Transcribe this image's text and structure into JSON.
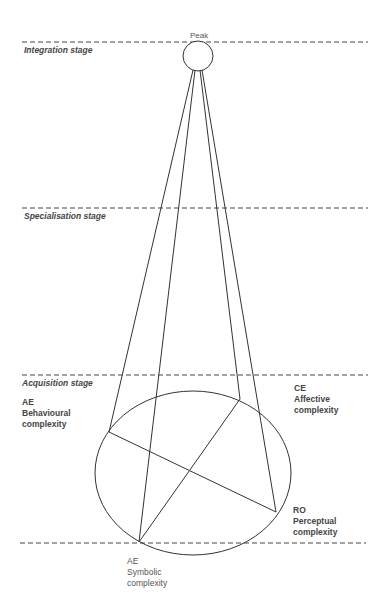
{
  "diagram": {
    "peak_label": "Peak",
    "stages": [
      {
        "label": "Integration stage",
        "y": 42
      },
      {
        "label": "Specialisation stage",
        "y": 208
      },
      {
        "label": "Acquisition stage",
        "y": 375
      }
    ],
    "nodes": {
      "behavioural": {
        "code": "AE",
        "name": "Behavioural",
        "sub": "complexity"
      },
      "affective": {
        "code": "CE",
        "name": "Affective",
        "sub": "complexity"
      },
      "perceptual": {
        "code": "RO",
        "name": "Perceptual",
        "sub": "complexity"
      },
      "symbolic": {
        "code": "AE",
        "name": "Symbolic",
        "sub": "complexity"
      }
    },
    "colors": {
      "line": "#333333",
      "dash": "#444444",
      "background": "#ffffff"
    }
  }
}
